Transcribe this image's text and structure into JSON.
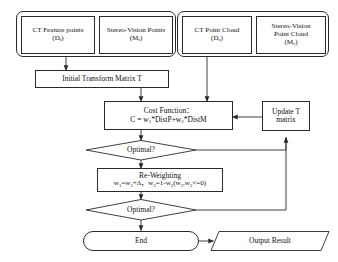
{
  "diagram": {
    "type": "flowchart",
    "background_color": "#ffffff",
    "stroke_color": "#2a2a2a",
    "text_color": "#111111"
  },
  "groups": {
    "feature_group": {
      "name": "feature-points-group",
      "boxes": [
        {
          "line1": "CT Feature points",
          "line2_pre": "(D",
          "line2_sub": "f",
          "line2_post": ")"
        },
        {
          "line1": "Stereo-Vision Points",
          "line2_pre": "(M",
          "line2_sub": "f",
          "line2_post": ")"
        }
      ]
    },
    "cloud_group": {
      "name": "point-cloud-group",
      "boxes": [
        {
          "line1": "CT Point Cloud",
          "line2": "",
          "line3_pre": "(D",
          "line3_sub": "c",
          "line3_post": ")"
        },
        {
          "line1": "Stereo-Vision",
          "line2": "Point Cloud",
          "line3_pre": "(M",
          "line3_sub": "c",
          "line3_post": ")"
        }
      ]
    }
  },
  "nodes": {
    "initial_transform": {
      "label": "Initial Transform Matrix T"
    },
    "cost_function": {
      "line1": "Cost Function：",
      "formula_pre": "C = w",
      "formula_sub1": "1",
      "formula_mid": "*DistP+w",
      "formula_sub2": "2",
      "formula_post": "*DistM"
    },
    "update_t": {
      "line1": "Update T",
      "line2": "matrix"
    },
    "optimal_1": {
      "label": "Optimal?"
    },
    "reweighting": {
      "line1": "Re-Weighting",
      "formula_a_pre": "w",
      "formula_a_sub": "1",
      "formula_a_mid": "=w",
      "formula_a_sub2": "1",
      "formula_a_post": "+Δ，w",
      "formula_b_sub": "2",
      "formula_b_mid": "=1-w",
      "formula_b_sub2": "2",
      "formula_b_post": "(w",
      "formula_c_sub": "1",
      "formula_c_mid": ",w",
      "formula_c_sub2": "2",
      "formula_c_post": "<=0)"
    },
    "optimal_2": {
      "label": "Optimal?"
    },
    "end": {
      "label": "End"
    },
    "output_result": {
      "label": "Output Result"
    }
  },
  "connectors": [
    {
      "name": "feature-group-to-initial-transform",
      "from": "feature_group",
      "to": "initial_transform",
      "arrow": true
    },
    {
      "name": "cloud-group-to-cost-function",
      "from": "cloud_group",
      "to": "cost_function",
      "arrow": true
    },
    {
      "name": "initial-transform-to-cost-function",
      "from": "initial_transform",
      "to": "cost_function",
      "arrow": true
    },
    {
      "name": "update-t-to-cost-function",
      "from": "update_t",
      "to": "cost_function",
      "arrow": true
    },
    {
      "name": "cost-function-to-optimal-1",
      "from": "cost_function",
      "to": "optimal_1",
      "arrow": true
    },
    {
      "name": "optimal-1-to-reweighting",
      "from": "optimal_1",
      "to": "reweighting",
      "arrow": true
    },
    {
      "name": "reweighting-to-optimal-2",
      "from": "reweighting",
      "to": "optimal_2",
      "arrow": true
    },
    {
      "name": "optimal-2-to-end",
      "from": "optimal_2",
      "to": "end",
      "arrow": true
    },
    {
      "name": "optimal-1-feedback-to-update-t",
      "from": "optimal_1",
      "to": "update_t",
      "arrow": true
    },
    {
      "name": "optimal-2-feedback-to-update-t",
      "from": "optimal_2",
      "to": "update_t",
      "arrow": true
    },
    {
      "name": "end-to-output-result",
      "from": "end",
      "to": "output_result",
      "arrow": true
    }
  ]
}
